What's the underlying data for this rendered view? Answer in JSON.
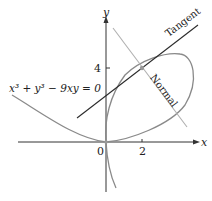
{
  "diagram": {
    "equation": "x³ + y³ − 9xy = 0",
    "axes": {
      "x_label": "x",
      "y_label": "y",
      "origin_label": "0",
      "x_tick": "2",
      "y_tick": "4"
    },
    "lines": {
      "tangent_label": "Tangent",
      "normal_label": "Normal"
    },
    "point": "(2, 4)",
    "colors": {
      "curve": "#8a8a8a",
      "tangent": "#2b2b2b",
      "normal": "#b0b0b0",
      "axis": "#333333"
    }
  }
}
